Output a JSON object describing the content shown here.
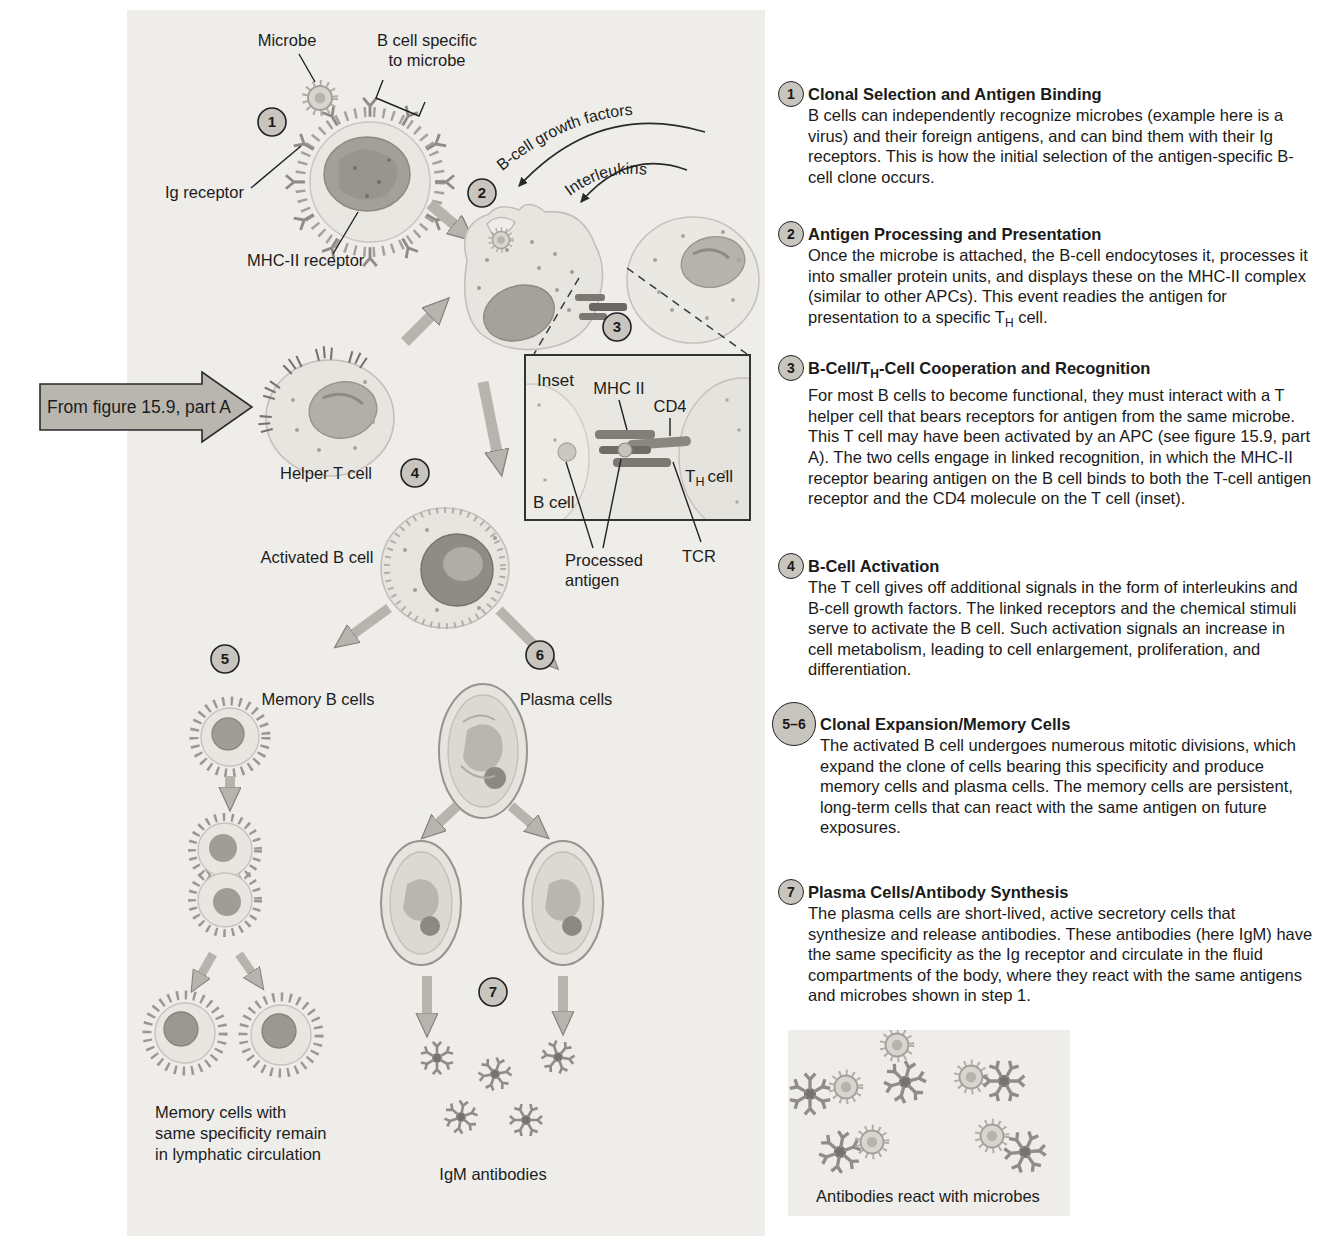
{
  "colors": {
    "panel_bg": "#eeedea",
    "badge_fill": "#c8c5bf",
    "arrow_fill": "#b7b4ae",
    "ink": "#1c1c1c"
  },
  "diagram": {
    "steps": [
      "1",
      "2",
      "3",
      "4",
      "5",
      "6",
      "7"
    ],
    "labels": {
      "microbe": "Microbe",
      "b_cell_specific_1": "B cell specific",
      "b_cell_specific_2": "to microbe",
      "ig_receptor": "Ig receptor",
      "mhc_ii_receptor": "MHC-II receptor",
      "growth_factors": "B-cell growth factors",
      "interleukins": "Interleukins",
      "from_figure": "From figure 15.9, part A",
      "helper_t_cell": "Helper T cell",
      "activated_b_cell": "Activated B cell",
      "memory_b_cells": "Memory B cells",
      "plasma_cells": "Plasma cells",
      "memory_note_1": "Memory cells with",
      "memory_note_2": "same specificity remain",
      "memory_note_3": "in lymphatic circulation",
      "igm_antibodies": "IgM antibodies"
    },
    "inset": {
      "title": "Inset",
      "mhc_ii": "MHC II",
      "cd4": "CD4",
      "b_cell": "B cell",
      "th_pre": "T",
      "th_sub": "H",
      "th_post": "cell",
      "tcr": "TCR",
      "processed_1": "Processed",
      "processed_2": "antigen"
    },
    "antibody_panel_caption": "Antibodies react with microbes"
  },
  "sections": [
    {
      "num": "1",
      "title": "Clonal Selection and Antigen Binding",
      "body": "B cells can independently recognize microbes (example here is a virus) and their foreign antigens, and can bind them with their Ig receptors. This is how the initial selection of the antigen-specific B-cell clone occurs."
    },
    {
      "num": "2",
      "title": "Antigen Processing and Presentation",
      "body_pre": "Once the microbe is attached, the B-cell endocytoses it, processes it into smaller protein units, and displays these on the MHC-II complex (similar to other APCs). This event readies the antigen for presentation to a specific T",
      "body_sub": "H",
      "body_post": " cell."
    },
    {
      "num": "3",
      "title_pre": "B-Cell/T",
      "title_sub": "H",
      "title_post": "-Cell Cooperation and Recognition",
      "body": "For most B cells to become functional, they must interact with a T helper cell that bears receptors for antigen from the same microbe. This T cell may have been activated by an APC (see figure 15.9, part A). The two cells engage in linked recognition, in which the MHC-II receptor bearing antigen on the B cell binds to both the T-cell antigen receptor and the CD4 molecule on the T cell (inset)."
    },
    {
      "num": "4",
      "title": "B-Cell Activation",
      "body": "The T cell gives off additional signals in the form of interleukins and B-cell growth factors. The linked receptors and the chemical stimuli serve to activate the B cell. Such activation signals an increase in cell metabolism, leading to cell enlargement, proliferation, and differentiation."
    },
    {
      "num": "5–6",
      "title": "Clonal Expansion/Memory Cells",
      "body": "The activated B cell undergoes numerous mitotic divisions, which expand the clone of cells bearing this specificity and produce memory cells and plasma cells. The memory cells are persistent, long-term cells that can react with the same antigen on future exposures."
    },
    {
      "num": "7",
      "title": "Plasma Cells/Antibody Synthesis",
      "body": "The plasma cells are short-lived, active secretory cells that synthesize and release antibodies. These antibodies (here IgM) have the same specificity as the Ig receptor and circulate in the fluid compartments of the body, where they react with the same antigens and microbes shown in step 1."
    }
  ]
}
